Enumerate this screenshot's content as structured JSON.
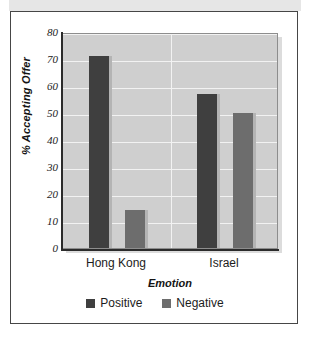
{
  "chart_data": {
    "type": "bar",
    "title": "",
    "xlabel": "Emotion",
    "ylabel": "% Accepting Offer",
    "categories": [
      "Hong Kong",
      "Israel"
    ],
    "series": [
      {
        "name": "Positive",
        "values": [
          71,
          57
        ],
        "color": "#3f3f3f"
      },
      {
        "name": "Negative",
        "values": [
          14,
          50
        ],
        "color": "#6d6d6d"
      }
    ],
    "ylim": [
      0,
      80
    ],
    "yticks": [
      80,
      70,
      60,
      50,
      40,
      30,
      20,
      10,
      0
    ],
    "ytick_labels": [
      "80",
      "70",
      "60",
      "50",
      "40",
      "30",
      "20",
      "10",
      "0"
    ],
    "grid": true,
    "grid_color": "#f2f2f2",
    "legend_position": "bottom",
    "plot_background": "#cfcfcf"
  },
  "axes": {
    "y_title": "% Accepting Offer",
    "x_title": "Emotion"
  },
  "legend": {
    "items": [
      {
        "label": "Positive",
        "color": "#3f3f3f"
      },
      {
        "label": "Negative",
        "color": "#6d6d6d"
      }
    ]
  },
  "x_categories": [
    {
      "label": "Hong Kong"
    },
    {
      "label": "Israel"
    }
  ],
  "y_ticks": [
    {
      "label": "80"
    },
    {
      "label": "70"
    },
    {
      "label": "60"
    },
    {
      "label": "50"
    },
    {
      "label": "40"
    },
    {
      "label": "30"
    },
    {
      "label": "20"
    },
    {
      "label": "10"
    },
    {
      "label": "0"
    }
  ]
}
